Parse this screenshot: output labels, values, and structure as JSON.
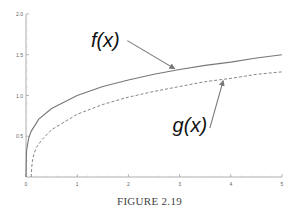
{
  "chart_data": {
    "type": "line",
    "title": "",
    "xlabel": "",
    "ylabel": "",
    "xlim": [
      0,
      5
    ],
    "ylim": [
      0,
      2.0
    ],
    "grid": false,
    "legend": "none",
    "x_ticks": [
      "0",
      "1",
      "2",
      "3",
      "4",
      "5"
    ],
    "y_ticks": [
      "0.5",
      "1.0",
      "1.5",
      "2.0"
    ],
    "series": [
      {
        "name": "f(x)",
        "style": "solid",
        "x": [
          0,
          0.01,
          0.05,
          0.1,
          0.25,
          0.5,
          1,
          1.5,
          2,
          2.5,
          3,
          3.5,
          4,
          4.5,
          5
        ],
        "values": [
          0,
          0.32,
          0.47,
          0.56,
          0.71,
          0.84,
          1.0,
          1.11,
          1.19,
          1.26,
          1.32,
          1.37,
          1.41,
          1.46,
          1.5
        ]
      },
      {
        "name": "g(x)",
        "style": "dashed",
        "x": [
          0.1,
          0.12,
          0.15,
          0.2,
          0.3,
          0.5,
          1,
          1.5,
          2,
          2.5,
          3,
          3.5,
          4,
          4.5,
          5
        ],
        "values": [
          0,
          0.18,
          0.27,
          0.36,
          0.45,
          0.58,
          0.77,
          0.89,
          0.98,
          1.05,
          1.11,
          1.17,
          1.21,
          1.26,
          1.29
        ]
      }
    ],
    "annotations": [
      {
        "text": "f(x)",
        "label_x": 1.55,
        "label_y": 1.6,
        "arrow_to_x": 2.9,
        "arrow_to_y": 1.33
      },
      {
        "text": "g(x)",
        "label_x": 3.2,
        "label_y": 0.55,
        "arrow_to_x": 3.85,
        "arrow_to_y": 1.18
      }
    ]
  },
  "caption": "FIGURE 2.19"
}
